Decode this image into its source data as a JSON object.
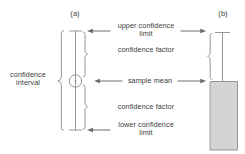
{
  "figure": {
    "type": "diagram",
    "panels": [
      {
        "id": "a",
        "tag": "(a)",
        "style": "interval-bar-with-mean-marker"
      },
      {
        "id": "b",
        "tag": "(b)",
        "style": "column-bar-with-error-bar"
      }
    ],
    "colors": {
      "stroke": "#808080",
      "text": "#3a3a3a",
      "bar_fill": "#d3d3d3",
      "background": "#ffffff"
    }
  },
  "labels": {
    "panel_a_tag": "(a)",
    "panel_b_tag": "(b)",
    "confidence_interval": "confidence\ninterval",
    "upper_confidence_limit": "upper confidence\nlimit",
    "confidence_factor_upper": "confidence factor",
    "sample_mean": "sample mean",
    "confidence_factor_lower": "confidence factor",
    "lower_confidence_limit": "lower confidence\nlimit"
  },
  "annotations": {
    "arrows": [
      {
        "name": "upper-limit-arrow-left",
        "direction": "left",
        "target": "panel-a-top-cap"
      },
      {
        "name": "upper-limit-arrow-right",
        "direction": "right",
        "target": "panel-b-top-cap"
      },
      {
        "name": "sample-mean-arrow-left",
        "direction": "left",
        "target": "panel-a-mean-marker"
      },
      {
        "name": "sample-mean-arrow-right",
        "direction": "right",
        "target": "panel-b-bar-top"
      },
      {
        "name": "lower-limit-arrow-left",
        "direction": "left",
        "target": "panel-a-bottom-cap"
      }
    ],
    "braces": [
      {
        "name": "confidence-interval-brace",
        "panel": "a",
        "side": "left",
        "spans": "full-interval"
      },
      {
        "name": "upper-confidence-factor-brace",
        "panel": "a",
        "side": "right",
        "spans": "mean-to-upper-limit"
      },
      {
        "name": "lower-confidence-factor-brace",
        "panel": "a",
        "side": "right",
        "spans": "mean-to-lower-limit"
      },
      {
        "name": "confidence-factor-brace-panel-b",
        "panel": "b",
        "side": "left",
        "spans": "bar-top-to-upper-limit"
      }
    ]
  }
}
